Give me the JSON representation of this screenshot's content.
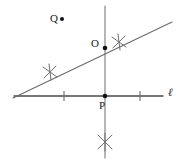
{
  "figure": {
    "background_color": "#ffffff",
    "stroke_color": "#4a4a4a",
    "point_color": "#111111",
    "label_color": "#1a1a1a",
    "width": 181,
    "height": 163
  },
  "labels": {
    "q": "Q",
    "o": "O",
    "p": "P",
    "line": "ℓ"
  },
  "points": [
    {
      "name": "Q",
      "label": "Q",
      "x": 62,
      "y": 19,
      "radius": 2.0
    },
    {
      "name": "O",
      "label": "O",
      "x": 105,
      "y": 48,
      "radius": 2.3
    },
    {
      "name": "P",
      "label": "P",
      "x": 105,
      "y": 96,
      "radius": 2.3
    }
  ],
  "lines": [
    {
      "name": "line-ell",
      "label": "ℓ",
      "x1": 14,
      "y1": 96,
      "x2": 163,
      "y2": 96
    },
    {
      "name": "vertical-line",
      "label": "",
      "x1": 105,
      "y1": 6,
      "x2": 105,
      "y2": 158
    },
    {
      "name": "diagonal-line",
      "label": "",
      "x1": 13,
      "y1": 98,
      "x2": 172,
      "y2": 22
    }
  ],
  "tick_marks": [
    {
      "name": "tick-left",
      "x": 64,
      "y": 96,
      "length": 10
    },
    {
      "name": "tick-right",
      "x": 140,
      "y": 96,
      "length": 10
    }
  ],
  "arc_crosses": [
    {
      "name": "arc-cross-upper-right",
      "x": 119,
      "y": 42,
      "size": 9
    },
    {
      "name": "arc-cross-left",
      "x": 50,
      "y": 72,
      "size": 9
    },
    {
      "name": "arc-cross-bottom",
      "x": 105,
      "y": 142,
      "size": 9
    }
  ]
}
